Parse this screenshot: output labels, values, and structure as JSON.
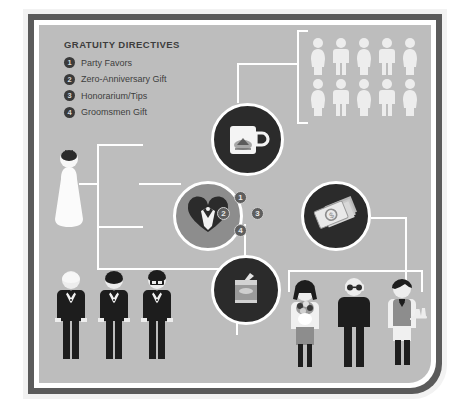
{
  "poster": {
    "background_color": "#bdbdbd",
    "frame_color": "#5b5b5b",
    "inner_border_color": "#ffffff"
  },
  "legend": {
    "title": "GRATUITY DIRECTIVES",
    "items": [
      {
        "number": "1",
        "label": "Party Favors"
      },
      {
        "number": "2",
        "label": "Zero-Anniversary Gift"
      },
      {
        "number": "3",
        "label": "Honorarium/Tips"
      },
      {
        "number": "4",
        "label": "Groomsmen Gift"
      }
    ]
  },
  "center_badges": [
    {
      "number": "1",
      "position": "top"
    },
    {
      "number": "2",
      "position": "left"
    },
    {
      "number": "3",
      "position": "right"
    },
    {
      "number": "4",
      "position": "bottom"
    }
  ],
  "icons": {
    "mug": {
      "name": "mug-icon",
      "circle_color": "#2b2b2b",
      "linked_to": "guests"
    },
    "heart": {
      "name": "heart-couple-icon",
      "circle_color": "#8d8d8d",
      "linked_to": "bride-and-groomsmen"
    },
    "money": {
      "name": "money-stack-icon",
      "circle_color": "#2b2b2b",
      "linked_to": "service-staff"
    },
    "gift": {
      "name": "gift-box-icon",
      "circle_color": "#2b2b2b",
      "linked_to": "service-staff"
    }
  },
  "groups": {
    "guests": {
      "label": "guests",
      "rows": 2,
      "per_row": 5,
      "total": 10
    },
    "bride": {
      "label": "bride"
    },
    "groomsmen": {
      "label": "groomsmen",
      "count": 3
    },
    "service_staff": {
      "label": "service staff",
      "count": 3
    }
  }
}
